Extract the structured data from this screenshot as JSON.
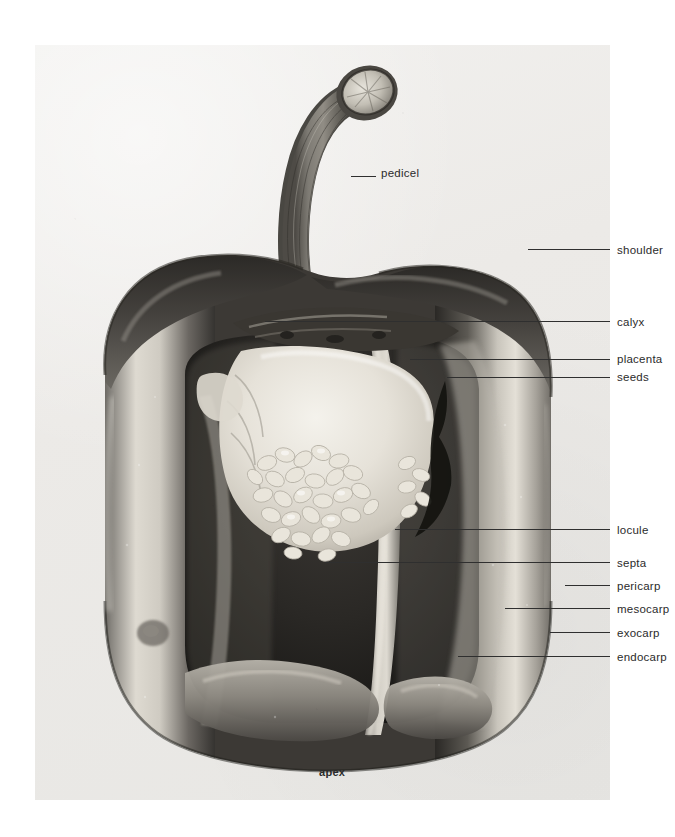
{
  "figure": {
    "plate_background": "#ececea",
    "label_color": "#2b2b2b",
    "leader_color": "#2f2f2f"
  },
  "labels": [
    {
      "id": "pedicel",
      "text": "pedicel",
      "x": 381,
      "y": 176,
      "leader_x1": 351,
      "leader_x2": 376,
      "leader_y": 176
    },
    {
      "id": "shoulder",
      "text": "shoulder",
      "x": 617,
      "y": 253,
      "leader_x1": 528,
      "leader_x2": 610,
      "leader_y": 249
    },
    {
      "id": "calyx",
      "text": "calyx",
      "x": 617,
      "y": 325,
      "leader_x1": 265,
      "leader_x2": 610,
      "leader_y": 321
    },
    {
      "id": "placenta",
      "text": "placenta",
      "x": 617,
      "y": 362,
      "leader_x1": 410,
      "leader_x2": 610,
      "leader_y": 359
    },
    {
      "id": "seeds",
      "text": "seeds",
      "x": 617,
      "y": 380,
      "leader_x1": 447,
      "leader_x2": 610,
      "leader_y": 377
    },
    {
      "id": "locule",
      "text": "locule",
      "x": 617,
      "y": 533,
      "leader_x1": 395,
      "leader_x2": 610,
      "leader_y": 529
    },
    {
      "id": "septa",
      "text": "septa",
      "x": 617,
      "y": 566,
      "leader_x1": 325,
      "leader_x2": 610,
      "leader_y": 562
    },
    {
      "id": "pericarp",
      "text": "pericarp",
      "x": 617,
      "y": 589,
      "leader_x1": 565,
      "leader_x2": 610,
      "leader_y": 585
    },
    {
      "id": "mesocarp",
      "text": "mesocarp",
      "x": 617,
      "y": 612,
      "leader_x1": 505,
      "leader_x2": 610,
      "leader_y": 608
    },
    {
      "id": "exocarp",
      "text": "exocarp",
      "x": 617,
      "y": 636,
      "leader_x1": 550,
      "leader_x2": 610,
      "leader_y": 632
    },
    {
      "id": "endocarp",
      "text": "endocarp",
      "x": 617,
      "y": 660,
      "leader_x1": 458,
      "leader_x2": 610,
      "leader_y": 656
    },
    {
      "id": "apex",
      "text": "apex",
      "x": 319,
      "y": 775,
      "leader_x1": 0,
      "leader_x2": 0,
      "leader_y": 0
    }
  ]
}
